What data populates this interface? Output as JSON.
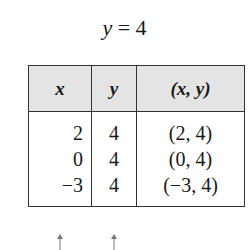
{
  "equation": {
    "lhs": "y",
    "op": "=",
    "rhs": "4"
  },
  "table": {
    "headers": [
      "x",
      "y",
      "(x, y)"
    ],
    "rows": [
      [
        "2",
        "4",
        "(2, 4)"
      ],
      [
        "0",
        "4",
        "(0, 4)"
      ],
      [
        "−3",
        "4",
        "(−3, 4)"
      ]
    ],
    "header_bg": "#e4e4e4"
  },
  "annotations": {
    "arrows": [
      "up-arrow-under-x-column",
      "up-arrow-under-y-column"
    ]
  }
}
